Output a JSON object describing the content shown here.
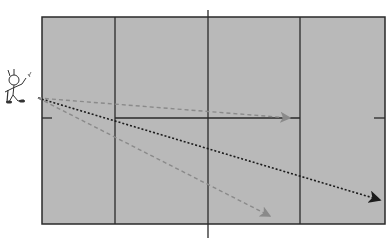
{
  "diagram": {
    "court": {
      "fill": "#b9b9b9",
      "line_color": "#2a2a2a",
      "bounds": {
        "left": 42,
        "top": 17,
        "right": 385,
        "bottom": 224
      },
      "vertical_lines_x": [
        115,
        208,
        300
      ],
      "net": {
        "x": 208,
        "top": 10,
        "bottom": 238
      },
      "center_line": {
        "y": 118,
        "x1": 115,
        "x2": 300
      },
      "end_marks": [
        {
          "x1": 42,
          "x2": 52,
          "y": 118
        },
        {
          "x1": 374,
          "x2": 385,
          "y": 118
        }
      ]
    },
    "player": {
      "label": "server-figure",
      "x": 4,
      "y": 74
    },
    "trajectories": [
      {
        "name": "short-serve-center",
        "style": "dashed",
        "color": "#8a8a8a",
        "from": [
          38,
          98
        ],
        "to": [
          290,
          118
        ]
      },
      {
        "name": "long-serve-back",
        "style": "dotted",
        "color": "#1c1c1c",
        "from": [
          38,
          98
        ],
        "to": [
          380,
          200
        ]
      },
      {
        "name": "mid-serve-wide",
        "style": "dashed",
        "color": "#8a8a8a",
        "from": [
          38,
          98
        ],
        "to": [
          270,
          216
        ]
      }
    ]
  }
}
